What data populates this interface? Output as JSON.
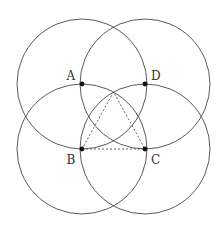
{
  "diagram": {
    "colors": {
      "circle_stroke": "#5a5a5a",
      "point_fill": "#111111",
      "label": "#333333",
      "dashed": "#555555"
    },
    "points": {
      "A": {
        "label": "A",
        "x": 82,
        "y": 84
      },
      "D": {
        "label": "D",
        "x": 145,
        "y": 84
      },
      "B": {
        "label": "B",
        "x": 82,
        "y": 149
      },
      "C": {
        "label": "C",
        "x": 145,
        "y": 149
      },
      "apex": {
        "x": 113.5,
        "y": 92
      }
    },
    "circles": [
      {
        "center": "A",
        "cx": 82,
        "cy": 84,
        "r": 65
      },
      {
        "center": "D",
        "cx": 145,
        "cy": 84,
        "r": 65
      },
      {
        "center": "B",
        "cx": 82,
        "cy": 149,
        "r": 65
      },
      {
        "center": "C",
        "cx": 145,
        "cy": 149,
        "r": 65
      }
    ],
    "dashed_triangle": [
      "B",
      "C",
      "apex"
    ],
    "labels": {
      "A": "A",
      "B": "B",
      "C": "C",
      "D": "D"
    }
  }
}
